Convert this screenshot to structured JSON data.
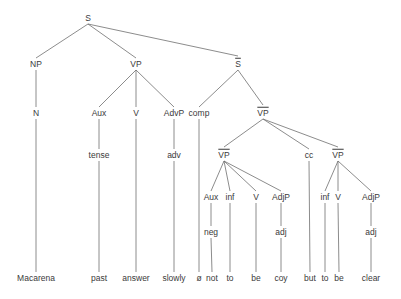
{
  "diagram": {
    "type": "syntax-tree",
    "nodes": [
      {
        "id": "S",
        "label": "S",
        "x": 88,
        "y": 18,
        "bar": false
      },
      {
        "id": "NP",
        "label": "NP",
        "x": 36,
        "y": 64,
        "bar": false
      },
      {
        "id": "VP",
        "label": "VP",
        "x": 136,
        "y": 64,
        "bar": false
      },
      {
        "id": "Sbar",
        "label": "S",
        "x": 238,
        "y": 64,
        "bar": true
      },
      {
        "id": "N",
        "label": "N",
        "x": 36,
        "y": 113,
        "bar": false
      },
      {
        "id": "Aux1",
        "label": "Aux",
        "x": 99,
        "y": 113,
        "bar": false
      },
      {
        "id": "V1",
        "label": "V",
        "x": 136,
        "y": 113,
        "bar": false
      },
      {
        "id": "AdvP",
        "label": "AdvP",
        "x": 174,
        "y": 113,
        "bar": false
      },
      {
        "id": "comp",
        "label": "comp",
        "x": 199,
        "y": 113,
        "bar": false
      },
      {
        "id": "VPbar",
        "label": "VP",
        "x": 263,
        "y": 113,
        "bar": true
      },
      {
        "id": "tense",
        "label": "tense",
        "x": 99,
        "y": 155,
        "bar": false
      },
      {
        "id": "adv",
        "label": "adv",
        "x": 174,
        "y": 155,
        "bar": false
      },
      {
        "id": "VPbarL",
        "label": "VP",
        "x": 224,
        "y": 155,
        "bar": true
      },
      {
        "id": "cc",
        "label": "cc",
        "x": 309,
        "y": 155,
        "bar": false
      },
      {
        "id": "VPbarR",
        "label": "VP",
        "x": 338,
        "y": 155,
        "bar": true
      },
      {
        "id": "Aux2",
        "label": "Aux",
        "x": 211,
        "y": 197,
        "bar": false
      },
      {
        "id": "inf1",
        "label": "inf",
        "x": 230,
        "y": 197,
        "bar": false
      },
      {
        "id": "V2",
        "label": "V",
        "x": 256,
        "y": 197,
        "bar": false
      },
      {
        "id": "AdjP1",
        "label": "AdjP",
        "x": 281,
        "y": 197,
        "bar": false
      },
      {
        "id": "inf2",
        "label": "inf",
        "x": 325,
        "y": 197,
        "bar": false
      },
      {
        "id": "V3",
        "label": "V",
        "x": 338,
        "y": 197,
        "bar": false
      },
      {
        "id": "AdjP2",
        "label": "AdjP",
        "x": 371,
        "y": 197,
        "bar": false
      },
      {
        "id": "neg",
        "label": "neg",
        "x": 211,
        "y": 232,
        "bar": false
      },
      {
        "id": "adj1",
        "label": "adj",
        "x": 281,
        "y": 232,
        "bar": false
      },
      {
        "id": "adj2",
        "label": "adj",
        "x": 371,
        "y": 232,
        "bar": false
      },
      {
        "id": "w_macarena",
        "label": "Macarena",
        "x": 36,
        "y": 278,
        "bar": false
      },
      {
        "id": "w_past",
        "label": "past",
        "x": 99,
        "y": 278,
        "bar": false
      },
      {
        "id": "w_answer",
        "label": "answer",
        "x": 136,
        "y": 278,
        "bar": false
      },
      {
        "id": "w_slowly",
        "label": "slowly",
        "x": 174,
        "y": 278,
        "bar": false
      },
      {
        "id": "w_null",
        "label": "ø",
        "x": 199,
        "y": 278,
        "bar": false
      },
      {
        "id": "w_not",
        "label": "not",
        "x": 212,
        "y": 278,
        "bar": false
      },
      {
        "id": "w_to1",
        "label": "to",
        "x": 230,
        "y": 278,
        "bar": false
      },
      {
        "id": "w_be1",
        "label": "be",
        "x": 256,
        "y": 278,
        "bar": false
      },
      {
        "id": "w_coy",
        "label": "coy",
        "x": 281,
        "y": 278,
        "bar": false
      },
      {
        "id": "w_but",
        "label": "but",
        "x": 310,
        "y": 278,
        "bar": false
      },
      {
        "id": "w_to2",
        "label": "to",
        "x": 325,
        "y": 278,
        "bar": false
      },
      {
        "id": "w_be2",
        "label": "be",
        "x": 339,
        "y": 278,
        "bar": false
      },
      {
        "id": "w_clear",
        "label": "clear",
        "x": 371,
        "y": 278,
        "bar": false
      }
    ],
    "edges": [
      [
        "S",
        "NP"
      ],
      [
        "S",
        "VP"
      ],
      [
        "S",
        "Sbar"
      ],
      [
        "NP",
        "N"
      ],
      [
        "N",
        "w_macarena"
      ],
      [
        "VP",
        "Aux1"
      ],
      [
        "VP",
        "V1"
      ],
      [
        "VP",
        "AdvP"
      ],
      [
        "Aux1",
        "tense"
      ],
      [
        "tense",
        "w_past"
      ],
      [
        "V1",
        "w_answer"
      ],
      [
        "AdvP",
        "adv"
      ],
      [
        "adv",
        "w_slowly"
      ],
      [
        "Sbar",
        "comp"
      ],
      [
        "Sbar",
        "VPbar"
      ],
      [
        "comp",
        "w_null"
      ],
      [
        "VPbar",
        "VPbarL"
      ],
      [
        "VPbar",
        "cc"
      ],
      [
        "VPbar",
        "VPbarR"
      ],
      [
        "VPbarL",
        "Aux2"
      ],
      [
        "VPbarL",
        "inf1"
      ],
      [
        "VPbarL",
        "V2"
      ],
      [
        "VPbarL",
        "AdjP1"
      ],
      [
        "Aux2",
        "neg"
      ],
      [
        "neg",
        "w_not"
      ],
      [
        "inf1",
        "w_to1"
      ],
      [
        "V2",
        "w_be1"
      ],
      [
        "AdjP1",
        "adj1"
      ],
      [
        "adj1",
        "w_coy"
      ],
      [
        "cc",
        "w_but"
      ],
      [
        "VPbarR",
        "inf2"
      ],
      [
        "VPbarR",
        "V3"
      ],
      [
        "VPbarR",
        "AdjP2"
      ],
      [
        "inf2",
        "w_to2"
      ],
      [
        "V3",
        "w_be2"
      ],
      [
        "AdjP2",
        "adj2"
      ],
      [
        "adj2",
        "w_clear"
      ]
    ],
    "colors": {
      "line": "#6e6e6e",
      "text": "#3a3a3a",
      "background": "#ffffff"
    }
  }
}
